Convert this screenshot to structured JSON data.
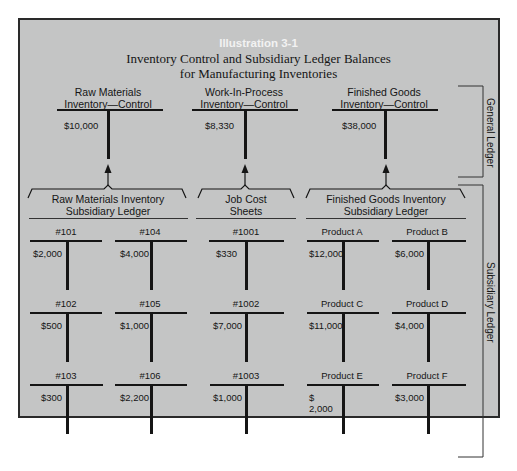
{
  "illustration_label": "Illustration 3-1",
  "title_line1": "Inventory Control and Subsidiary Ledger Balances",
  "title_line2": "for Manufacturing Inventories",
  "side_labels": {
    "general": "General Ledger",
    "subsidiary": "Subsidiary Ledger"
  },
  "control_accounts": [
    {
      "line1": "Raw Materials",
      "line2": "Inventory—Control",
      "balance": "$10,000"
    },
    {
      "line1": "Work-In-Process",
      "line2": "Inventory—Control",
      "balance": "$8,330"
    },
    {
      "line1": "Finished Goods",
      "line2": "Inventory—Control",
      "balance": "$38,000"
    }
  ],
  "subsidiary_groups": [
    {
      "line1": "Raw Materials Inventory",
      "line2": "Subsidiary Ledger"
    },
    {
      "line1": "Job Cost",
      "line2": "Sheets"
    },
    {
      "line1": "Finished Goods Inventory",
      "line2": "Subsidiary Ledger"
    }
  ],
  "subsidiary_accounts": [
    [
      {
        "name": "#101",
        "balance": "$2,000"
      },
      {
        "name": "#104",
        "balance": "$4,000"
      },
      {
        "name": "#1001",
        "balance": "$330"
      },
      {
        "name": "Product A",
        "balance": "$12,000"
      },
      {
        "name": "Product B",
        "balance": "$6,000"
      }
    ],
    [
      {
        "name": "#102",
        "balance": "$500"
      },
      {
        "name": "#105",
        "balance": "$1,000"
      },
      {
        "name": "#1002",
        "balance": "$7,000"
      },
      {
        "name": "Product C",
        "balance": "$11,000"
      },
      {
        "name": "Product D",
        "balance": "$4,000"
      }
    ],
    [
      {
        "name": "#103",
        "balance": "$300"
      },
      {
        "name": "#106",
        "balance": "$2,200"
      },
      {
        "name": "#1003",
        "balance": "$1,000"
      },
      {
        "name": "Product E",
        "balance": "$ 2,000"
      },
      {
        "name": "Product F",
        "balance": "$3,000"
      }
    ]
  ],
  "colors": {
    "panel": "#c4c5c5",
    "ink": "#151515",
    "label_white": "#f2f2f2"
  }
}
